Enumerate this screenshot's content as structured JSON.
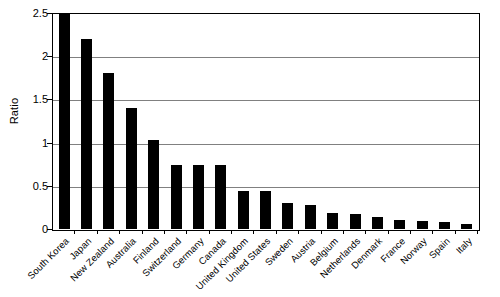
{
  "chart_data": {
    "type": "bar",
    "title": "",
    "xlabel": "",
    "ylabel": "Ratio",
    "ylim": [
      0,
      2.5
    ],
    "yticks": [
      "0",
      "0.5",
      "1",
      "1.5",
      "2",
      "2.5"
    ],
    "ytick_values": [
      0,
      0.5,
      1,
      1.5,
      2,
      2.5
    ],
    "grid": true,
    "legend": "none",
    "bar_color": "#000000",
    "gridline_color": "#808080",
    "axis_color": "#000000",
    "categories": [
      "South Korea",
      "Japan",
      "New Zealand",
      "Australia",
      "Finland",
      "Switzerland",
      "Germany",
      "Canada",
      "United Kingdom",
      "United States",
      "Sweden",
      "Austria",
      "Belgium",
      "Netherlands",
      "Denmark",
      "France",
      "Norway",
      "Spain",
      "Italy"
    ],
    "values": [
      2.5,
      2.21,
      1.81,
      1.41,
      1.03,
      0.75,
      0.75,
      0.74,
      0.44,
      0.44,
      0.3,
      0.28,
      0.19,
      0.18,
      0.14,
      0.11,
      0.09,
      0.08,
      0.06
    ]
  }
}
